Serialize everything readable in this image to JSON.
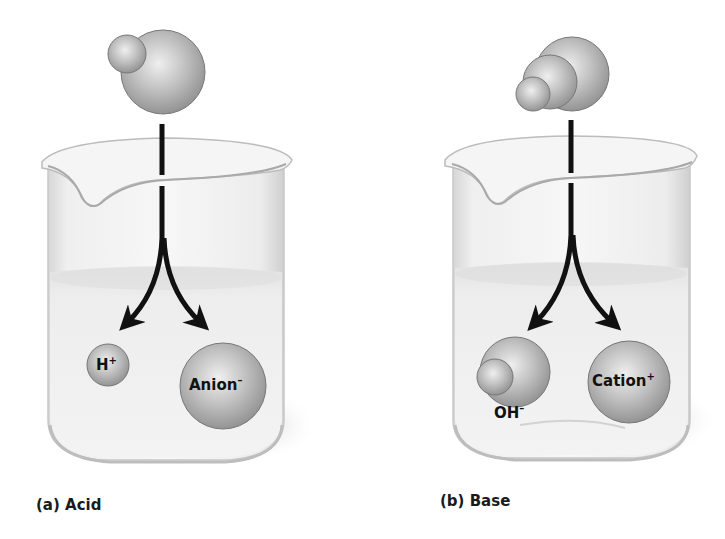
{
  "panels": [
    {
      "id": "acid",
      "caption": "(a) Acid",
      "ions": [
        {
          "base": "H",
          "charge": "+"
        },
        {
          "base": "Anion",
          "charge": "–"
        }
      ]
    },
    {
      "id": "base",
      "caption": "(b) Base",
      "ions": [
        {
          "base": "OH",
          "charge": "–"
        },
        {
          "base": "Cation",
          "charge": "+"
        }
      ]
    }
  ],
  "colors": {
    "sphere_light": "#e4e4e4",
    "sphere_mid": "#b8b8b8",
    "sphere_dark": "#8a8a8a",
    "sphere_stroke": "#6e6e6e",
    "glass": "#f1f1f1",
    "liquid": "#e6e6e6",
    "arrow": "#111111"
  }
}
